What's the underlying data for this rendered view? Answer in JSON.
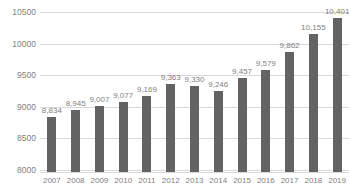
{
  "chart_data": {
    "type": "bar",
    "title": "",
    "xlabel": "",
    "ylabel": "",
    "categories": [
      "2007",
      "2008",
      "2009",
      "2010",
      "2011",
      "2012",
      "2013",
      "2014",
      "2015",
      "2016",
      "2017",
      "2018",
      "2019"
    ],
    "values": [
      8834,
      8945,
      9007,
      9077,
      9169,
      9363,
      9330,
      9246,
      9457,
      9579,
      9862,
      10155,
      10401
    ],
    "value_labels": [
      "8,834",
      "8,945",
      "9,007",
      "9,077",
      "9,169",
      "9,363",
      "9,330",
      "9,246",
      "9,457",
      "9,579",
      "9,862",
      "10,155",
      "10,401"
    ],
    "ylim": [
      8000,
      10500
    ],
    "ytick_labels": [
      "10500",
      "10000",
      "9500",
      "9000",
      "8500",
      "8000"
    ],
    "ytick_values": [
      10500,
      10000,
      9500,
      9000,
      8500,
      8000
    ],
    "grid": true,
    "legend": false,
    "bar_color": "#636363",
    "gridline_color": "#d9d9d9",
    "label_color": "#7f7f7f"
  }
}
